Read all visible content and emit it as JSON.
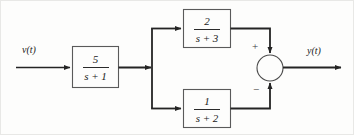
{
  "diagram": {
    "type": "control-system-block-diagram",
    "background_color": "#fdfdfc",
    "line_color": "#242424",
    "box_border_color": "#4a4a4a",
    "input": {
      "label": "v(t)"
    },
    "output": {
      "label": "y(t)"
    },
    "blocks": [
      {
        "id": "block-gain-1",
        "numerator": "5",
        "denominator": "s + 1"
      },
      {
        "id": "block-upper-path",
        "numerator": "2",
        "denominator": "s + 3"
      },
      {
        "id": "block-lower-path",
        "numerator": "1",
        "denominator": "s + 2"
      }
    ],
    "summing_junction": {
      "id": "summing-junction",
      "upper_sign": "+",
      "lower_sign": "−"
    }
  }
}
